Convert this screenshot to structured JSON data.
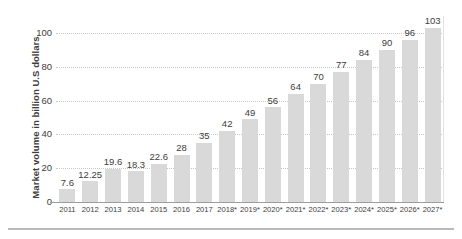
{
  "chart_data": {
    "type": "bar",
    "title": "",
    "subtitle": "",
    "xlabel": "",
    "ylabel": "Market volume in billion U.S dollars",
    "ylim": [
      0,
      110
    ],
    "yticks": [
      0,
      20,
      40,
      60,
      80,
      100
    ],
    "grid": true,
    "legend": null,
    "categories": [
      "2011",
      "2012",
      "2013",
      "2014",
      "2015",
      "2016",
      "2017",
      "2018*",
      "2019*",
      "2020*",
      "2021*",
      "2022*",
      "2023*",
      "2024*",
      "2025*",
      "2026*",
      "2027*"
    ],
    "values": [
      7.6,
      12.25,
      19.6,
      18.3,
      22.6,
      28,
      35,
      42,
      49,
      56,
      64,
      70,
      77,
      84,
      90,
      96,
      103
    ],
    "value_labels": [
      "7.6",
      "12.25",
      "19.6",
      "18.3",
      "22.6",
      "28",
      "35",
      "42",
      "49",
      "56",
      "64",
      "70",
      "77",
      "84",
      "90",
      "96",
      "103"
    ],
    "bar_color": "#d9d9d9",
    "grid_color": "#c8c8c8",
    "axis_color": "#9d9d9d",
    "text_color": "#3d3d3d",
    "background": "#ffffff",
    "note": "* denotes projected values"
  }
}
